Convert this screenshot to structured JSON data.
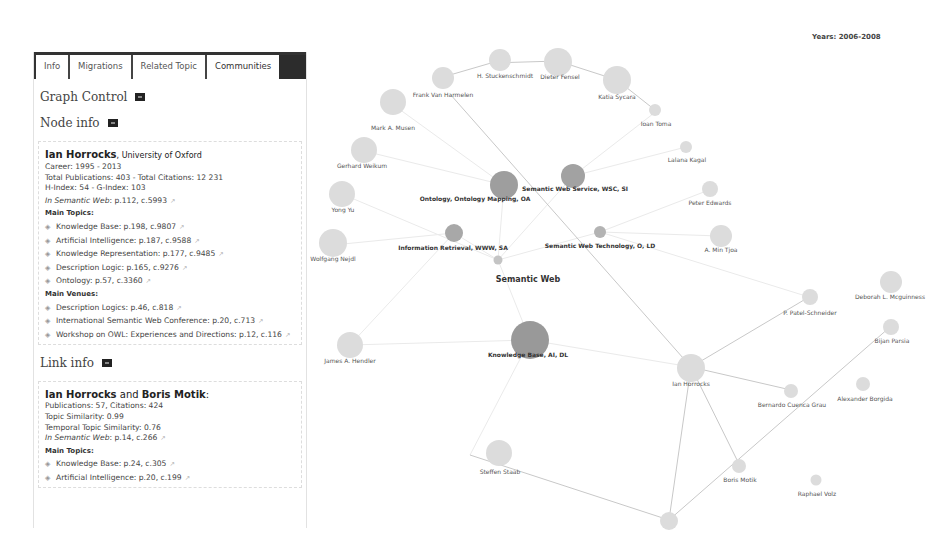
{
  "years_label": "Years: 2006-2008",
  "tabs": [
    {
      "label": "Info",
      "active": false
    },
    {
      "label": "Migrations",
      "active": false
    },
    {
      "label": "Related Topic",
      "active": false
    },
    {
      "label": "Communities",
      "active": true
    }
  ],
  "graph_control": {
    "title": "Graph Control"
  },
  "node_info": {
    "title": "Node info",
    "name": "Ian Horrocks",
    "affiliation": ", University of Oxford",
    "career": "Career: 1995 - 2013",
    "totals": "Total Publications: 403 - Total Citations: 12 231",
    "indices": "H-Index: 54 - G-Index: 103",
    "in_prefix": "In ",
    "in_topic": "Semantic Web",
    "in_stats": ": p.112, c.5993",
    "main_topics_label": "Main Topics:",
    "main_topics": [
      "Knowledge Base: p.198, c.9807",
      "Artificial Intelligence: p.187, c.9588",
      "Knowledge Representation: p.177, c.9485",
      "Description Logic: p.165, c.9276",
      "Ontology: p.57, c.3360"
    ],
    "main_venues_label": "Main Venues:",
    "main_venues": [
      "Description Logics: p.46, c.818",
      "International Semantic Web Conference: p.20, c.713",
      "Workshop on OWL: Experiences and Directions: p.12, c.116"
    ]
  },
  "link_info": {
    "title": "Link info",
    "name_a": "Ian Horrocks",
    "and": " and ",
    "name_b": "Boris Motik",
    "colon": ":",
    "publications": "Publications: 57, Citations: 424",
    "topic_similarity": "Topic Similarity: 0.99",
    "temporal_similarity": "Temporal Topic Similarity: 0.76",
    "in_prefix": "In ",
    "in_topic": "Semantic Web",
    "in_stats": ": p.14, c.266",
    "main_topics_label": "Main Topics:",
    "main_topics": [
      "Knowledge Base: p.24, c.305",
      "Artificial Intelligence: p.20, c.199"
    ]
  },
  "graph": {
    "center_label": "Semantic Web",
    "communities": [
      "Ontology, Ontology Mapping, OA",
      "Semantic Web Service, WSC, SI",
      "Information Retrieval, WWW, SA",
      "Semantic Web Technology, O, LD",
      "Knowledge Base, AI, DL"
    ],
    "authors": [
      "H. Stuckenschmidt",
      "Dieter Fensel",
      "Frank Van Harmelen",
      "Katia Sycara",
      "Ioan Toma",
      "Mark A. Musen",
      "Lalana Kagal",
      "Gerhard Weikum",
      "Peter Edwards",
      "Yong Yu",
      "A. Min Tjoa",
      "Wolfgang Nejdl",
      "Deborah L. Mcguinness",
      "P. Patel-Schneider",
      "Bijan Parsia",
      "James A. Hendler",
      "Ian Horrocks",
      "Bernardo Cuenca Grau",
      "Alexander Borgida",
      "Steffen Staab",
      "Boris Motik",
      "Raphael Volz"
    ]
  },
  "caption": "Fig. 4. Screenshot of the ..."
}
